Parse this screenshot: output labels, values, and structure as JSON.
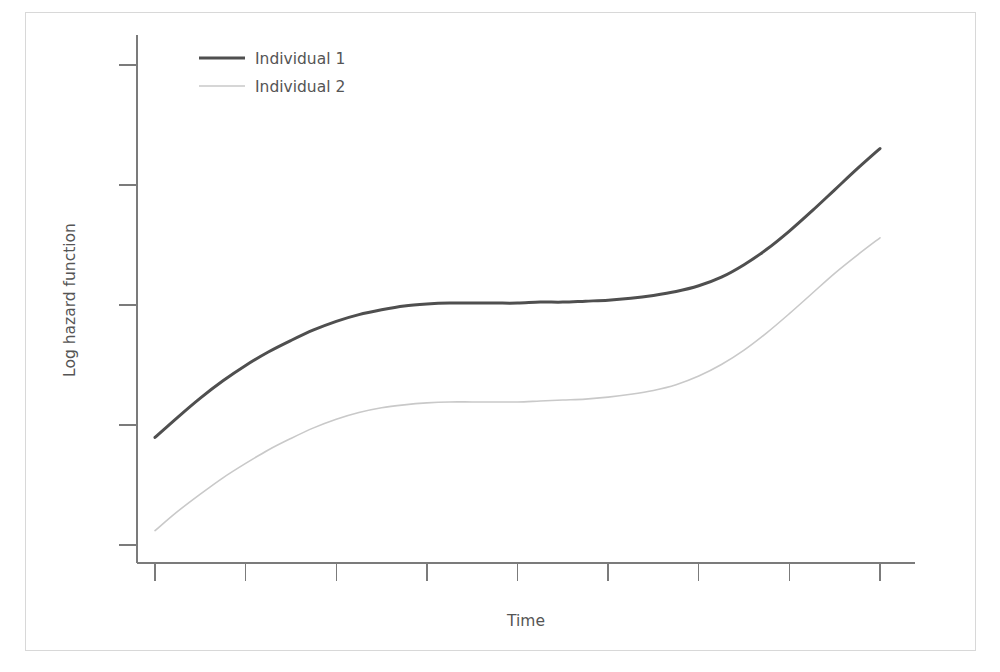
{
  "figure": {
    "background_color": "#ffffff",
    "frame_color": "#d8d8d8",
    "axis_color": "#7b7b7b"
  },
  "axes": {
    "x_label": "Time",
    "y_label": "Log hazard function",
    "x_tick_count": 9,
    "y_tick_count": 5,
    "x_tick_labels": [
      "",
      "",
      "",
      "",
      "",
      "",
      "",
      "",
      ""
    ],
    "y_tick_labels": [
      "",
      "",
      "",
      "",
      ""
    ]
  },
  "legend": {
    "position": "top-left-inside",
    "entries": [
      {
        "label": "Individual 1",
        "color": "#4f4f4f",
        "width": 3.0
      },
      {
        "label": "Individual 2",
        "color": "#c9c9c9",
        "width": 1.6
      }
    ]
  },
  "chart_data": {
    "type": "line",
    "title": "",
    "subtitle": "",
    "xlabel": "Time",
    "ylabel": "Log hazard function",
    "xlim": [
      0,
      8
    ],
    "ylim": [
      0,
      5
    ],
    "grid": false,
    "legend_position": "top-left-inside",
    "x_ticks": [
      0,
      1,
      2,
      3,
      4,
      5,
      6,
      7,
      8
    ],
    "y_ticks": [
      0,
      1,
      2,
      3,
      4
    ],
    "x": [
      0,
      0.25,
      0.5,
      0.75,
      1.0,
      1.25,
      1.5,
      1.75,
      2.0,
      2.25,
      2.5,
      2.75,
      3.0,
      3.25,
      3.5,
      3.75,
      4.0,
      4.25,
      4.5,
      4.75,
      5.0,
      5.25,
      5.5,
      5.75,
      6.0,
      6.25,
      6.5,
      6.75,
      7.0,
      7.25,
      7.5,
      7.75,
      8.0
    ],
    "series": [
      {
        "name": "Individual 1",
        "color": "#4f4f4f",
        "width": 3.0,
        "values": [
          1.12,
          1.33,
          1.53,
          1.71,
          1.87,
          2.01,
          2.13,
          2.24,
          2.33,
          2.4,
          2.45,
          2.49,
          2.51,
          2.52,
          2.52,
          2.52,
          2.52,
          2.53,
          2.53,
          2.54,
          2.55,
          2.57,
          2.6,
          2.64,
          2.7,
          2.79,
          2.92,
          3.08,
          3.27,
          3.48,
          3.7,
          3.92,
          4.13
        ]
      },
      {
        "name": "Individual 2",
        "color": "#c9c9c9",
        "width": 1.6,
        "values": [
          0.15,
          0.35,
          0.53,
          0.7,
          0.85,
          0.99,
          1.11,
          1.22,
          1.31,
          1.38,
          1.43,
          1.46,
          1.48,
          1.49,
          1.49,
          1.49,
          1.49,
          1.5,
          1.51,
          1.52,
          1.54,
          1.57,
          1.61,
          1.67,
          1.76,
          1.88,
          2.03,
          2.21,
          2.41,
          2.62,
          2.83,
          3.02,
          3.2
        ]
      }
    ],
    "annotations": []
  }
}
